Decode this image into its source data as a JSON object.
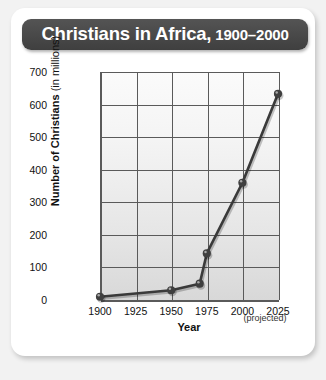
{
  "title": {
    "main": "Christians in Africa,",
    "years": "1900–2000",
    "full": "Christians in Africa, 1900–2000"
  },
  "axes": {
    "x_title": "Year",
    "y_title_bold": "Number of Christians",
    "y_title_light": "(in millions)",
    "projected_note": "(projected)"
  },
  "colors": {
    "banner": "#4a4a4a",
    "banner_text": "#ffffff",
    "line": "#3a3a3a",
    "marker": "#3f3f3f",
    "grid": "#5a5a5a",
    "plot_bg_top": "#fbfbfb",
    "plot_bg_bottom": "#d8d8d8",
    "card_bg": "#ffffff",
    "page_bg": "#f2f2f2"
  },
  "chart_data": {
    "type": "line",
    "title": "Christians in Africa, 1900–2000",
    "xlabel": "Year",
    "ylabel": "Number of Christians (in millions)",
    "xlim": [
      1900,
      2025
    ],
    "ylim": [
      0,
      700
    ],
    "xticks": [
      1900,
      1925,
      1950,
      1975,
      2000,
      2025
    ],
    "xtick_labels": [
      "1900",
      "1925",
      "1950",
      "1975",
      "2000",
      "2025"
    ],
    "yticks": [
      0,
      100,
      200,
      300,
      400,
      500,
      600,
      700
    ],
    "ytick_labels": [
      "0",
      "100",
      "200",
      "300",
      "400",
      "500",
      "600",
      "700"
    ],
    "grid": true,
    "legend": false,
    "annotations": [
      "(projected)"
    ],
    "series": [
      {
        "name": "Christians in Africa (millions)",
        "x": [
          1900,
          1950,
          1970,
          1975,
          2000,
          2025
        ],
        "values": [
          10,
          30,
          50,
          143,
          360,
          633
        ]
      }
    ]
  }
}
